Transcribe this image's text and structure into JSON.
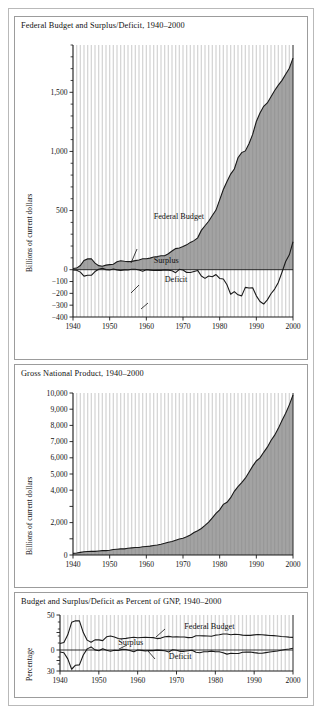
{
  "figure": {
    "background": "#ffffff",
    "frame_color": "#b9b9b9",
    "area_fill": "#808080",
    "gridline_color": "#d6d6d6",
    "line_color": "#1a1a1a"
  },
  "chart_data": [
    {
      "id": "federal-budget",
      "type": "area",
      "title": "Federal Budget and Surplus/Deficit, 1940–2000",
      "xlabel": "",
      "ylabel": "Billions of current dollars",
      "xlim": [
        1940,
        2000
      ],
      "ylim": [
        -400,
        1900
      ],
      "ytick_values": [
        1500,
        1000,
        500,
        0,
        -100,
        -200,
        -300,
        -400
      ],
      "ytick_labels": [
        "1,500",
        "1,000",
        "500",
        "0",
        "−100",
        "−200",
        "−300",
        "−400"
      ],
      "xtick_values": [
        1940,
        1950,
        1960,
        1970,
        1980,
        1990,
        2000
      ],
      "xtick_labels": [
        "1940",
        "1950",
        "1960",
        "1970",
        "1980",
        "1990",
        "2000"
      ],
      "grid": "vertical-yearly",
      "annotations": [
        {
          "text": "Federal Budget",
          "x": 1962,
          "y": 430
        },
        {
          "text": "Surplus",
          "x": 1962,
          "y": 60
        },
        {
          "text": "Deficit",
          "x": 1965,
          "y": -105
        }
      ],
      "series": [
        {
          "name": "Federal Budget",
          "kind": "area",
          "x": [
            1940,
            1941,
            1942,
            1943,
            1944,
            1945,
            1946,
            1947,
            1948,
            1949,
            1950,
            1951,
            1952,
            1953,
            1954,
            1955,
            1956,
            1957,
            1958,
            1959,
            1960,
            1961,
            1962,
            1963,
            1964,
            1965,
            1966,
            1967,
            1968,
            1969,
            1970,
            1971,
            1972,
            1973,
            1974,
            1975,
            1976,
            1977,
            1978,
            1979,
            1980,
            1981,
            1982,
            1983,
            1984,
            1985,
            1986,
            1987,
            1988,
            1989,
            1990,
            1991,
            1992,
            1993,
            1994,
            1995,
            1996,
            1997,
            1998,
            1999,
            2000
          ],
          "values": [
            9.5,
            13.7,
            35.1,
            78.6,
            91.3,
            92.7,
            55.2,
            34.5,
            29.8,
            38.8,
            42.6,
            45.5,
            67.7,
            76.1,
            70.9,
            68.4,
            70.6,
            76.6,
            82.4,
            92.1,
            92.2,
            97.7,
            106.8,
            111.3,
            118.5,
            118.2,
            134.5,
            157.5,
            178.1,
            183.6,
            195.6,
            210.2,
            230.7,
            245.7,
            269.4,
            332.3,
            371.8,
            409.2,
            458.7,
            504.0,
            590.9,
            678.2,
            745.7,
            808.4,
            851.8,
            946.3,
            990.4,
            1004.1,
            1064.5,
            1143.7,
            1253.2,
            1324.4,
            1381.6,
            1409.5,
            1461.9,
            1515.8,
            1560.6,
            1601.3,
            1652.6,
            1703.0,
            1789.1
          ]
        },
        {
          "name": "Surplus/Deficit",
          "kind": "line",
          "x": [
            1940,
            1941,
            1942,
            1943,
            1944,
            1945,
            1946,
            1947,
            1948,
            1949,
            1950,
            1951,
            1952,
            1953,
            1954,
            1955,
            1956,
            1957,
            1958,
            1959,
            1960,
            1961,
            1962,
            1963,
            1964,
            1965,
            1966,
            1967,
            1968,
            1969,
            1970,
            1971,
            1972,
            1973,
            1974,
            1975,
            1976,
            1977,
            1978,
            1979,
            1980,
            1981,
            1982,
            1983,
            1984,
            1985,
            1986,
            1987,
            1988,
            1989,
            1990,
            1991,
            1992,
            1993,
            1994,
            1995,
            1996,
            1997,
            1998,
            1999,
            2000
          ],
          "values": [
            -2.9,
            -4.9,
            -20.5,
            -54.6,
            -47.6,
            -47.6,
            -15.9,
            4.0,
            11.8,
            0.6,
            -3.1,
            6.1,
            -1.5,
            -6.5,
            -1.2,
            -3.0,
            3.9,
            3.4,
            -2.8,
            -12.8,
            0.3,
            -3.3,
            -7.1,
            -4.8,
            -5.9,
            -1.4,
            -3.7,
            -8.6,
            -25.2,
            3.2,
            -2.8,
            -23.0,
            -23.4,
            -14.9,
            -6.1,
            -53.2,
            -73.7,
            -53.7,
            -59.2,
            -40.7,
            -73.8,
            -79.0,
            -128.0,
            -207.8,
            -185.4,
            -212.3,
            -221.2,
            -149.7,
            -155.2,
            -152.6,
            -221.0,
            -269.2,
            -290.3,
            -255.1,
            -203.2,
            -164.0,
            -107.4,
            -21.9,
            69.2,
            125.6,
            236.2
          ]
        }
      ]
    },
    {
      "id": "gnp",
      "type": "area",
      "title": "Gross National Product, 1940–2000",
      "xlabel": "",
      "ylabel": "Billions of current dollars",
      "xlim": [
        1940,
        2000
      ],
      "ylim": [
        0,
        10000
      ],
      "ytick_values": [
        10000,
        9000,
        8000,
        7000,
        6000,
        5000,
        4000,
        3000,
        2000,
        1000,
        0
      ],
      "ytick_labels": [
        "10,000",
        "9,000",
        "8,000",
        "7,000",
        "6,000",
        "5,000",
        "4,000",
        "",
        "2,000",
        "",
        "0"
      ],
      "xtick_values": [
        1940,
        1950,
        1960,
        1970,
        1980,
        1990,
        2000
      ],
      "xtick_labels": [
        "1940",
        "1950",
        "1960",
        "1970",
        "1980",
        "1990",
        "2000"
      ],
      "grid": "vertical-yearly",
      "annotations": [],
      "series": [
        {
          "name": "Gross National Product",
          "kind": "area",
          "x": [
            1940,
            1941,
            1942,
            1943,
            1944,
            1945,
            1946,
            1947,
            1948,
            1949,
            1950,
            1951,
            1952,
            1953,
            1954,
            1955,
            1956,
            1957,
            1958,
            1959,
            1960,
            1961,
            1962,
            1963,
            1964,
            1965,
            1966,
            1967,
            1968,
            1969,
            1970,
            1971,
            1972,
            1973,
            1974,
            1975,
            1976,
            1977,
            1978,
            1979,
            1980,
            1981,
            1982,
            1983,
            1984,
            1985,
            1986,
            1987,
            1988,
            1989,
            1990,
            1991,
            1992,
            1993,
            1994,
            1995,
            1996,
            1997,
            1998,
            1999,
            2000
          ],
          "values": [
            101,
            127,
            162,
            199,
            219,
            223,
            222,
            244,
            270,
            267,
            294,
            339,
            358,
            379,
            380,
            415,
            438,
            461,
            467,
            507,
            529,
            548,
            589,
            622,
            668,
            724,
            792,
            834,
            911,
            985,
            1039,
            1128,
            1241,
            1386,
            1501,
            1635,
            1825,
            2030,
            2294,
            2563,
            2789,
            3128,
            3255,
            3536,
            3933,
            4220,
            4463,
            4740,
            5104,
            5484,
            5803,
            5995,
            6338,
            6657,
            7072,
            7398,
            7817,
            8304,
            8747,
            9268,
            9873
          ]
        }
      ]
    },
    {
      "id": "percent-of-gnp",
      "type": "line",
      "title": "Budget and Surplus/Deficit as Percent of GNP, 1940–2000",
      "xlabel": "",
      "ylabel": "Percentage",
      "xlim": [
        1940,
        2000
      ],
      "ylim": [
        -30,
        50
      ],
      "ytick_values": [
        50,
        25,
        0,
        -15,
        -30
      ],
      "ytick_labels": [
        "50",
        "",
        "0",
        "",
        "30"
      ],
      "xtick_values": [
        1940,
        1950,
        1960,
        1970,
        1980,
        1990,
        2000
      ],
      "xtick_labels": [
        "1940",
        "1950",
        "1960",
        "1970",
        "1980",
        "1990",
        "2000"
      ],
      "grid": "vertical-yearly",
      "annotations": [
        {
          "text": "Federal Budget",
          "x": 1972,
          "y": 30
        },
        {
          "text": "Surplus",
          "x": 1955,
          "y": 7
        },
        {
          "text": "Deficit",
          "x": 1968,
          "y": -13
        }
      ],
      "series": [
        {
          "name": "Federal Budget",
          "kind": "line",
          "x": [
            1940,
            1941,
            1942,
            1943,
            1944,
            1945,
            1946,
            1947,
            1948,
            1949,
            1950,
            1951,
            1952,
            1953,
            1954,
            1955,
            1956,
            1957,
            1958,
            1959,
            1960,
            1961,
            1962,
            1963,
            1964,
            1965,
            1966,
            1967,
            1968,
            1969,
            1970,
            1971,
            1972,
            1973,
            1974,
            1975,
            1976,
            1977,
            1978,
            1979,
            1980,
            1981,
            1982,
            1983,
            1984,
            1985,
            1986,
            1987,
            1988,
            1989,
            1990,
            1991,
            1992,
            1993,
            1994,
            1995,
            1996,
            1997,
            1998,
            1999,
            2000
          ],
          "values": [
            9.4,
            10.8,
            21.7,
            39.5,
            41.7,
            41.6,
            24.9,
            14.1,
            11.0,
            14.5,
            14.5,
            13.4,
            18.9,
            20.1,
            18.7,
            16.5,
            16.1,
            16.6,
            17.6,
            18.2,
            17.4,
            17.8,
            18.1,
            17.9,
            17.7,
            16.3,
            17.0,
            18.9,
            19.5,
            18.6,
            18.8,
            18.6,
            18.6,
            17.7,
            17.9,
            20.3,
            20.4,
            20.2,
            20.0,
            19.7,
            21.2,
            21.7,
            22.9,
            22.9,
            21.7,
            22.4,
            22.2,
            21.2,
            20.9,
            20.9,
            21.6,
            22.1,
            21.8,
            21.2,
            20.7,
            20.5,
            20.0,
            19.3,
            18.9,
            18.4,
            18.1
          ]
        },
        {
          "name": "Surplus/Deficit",
          "kind": "line",
          "x": [
            1940,
            1941,
            1942,
            1943,
            1944,
            1945,
            1946,
            1947,
            1948,
            1949,
            1950,
            1951,
            1952,
            1953,
            1954,
            1955,
            1956,
            1957,
            1958,
            1959,
            1960,
            1961,
            1962,
            1963,
            1964,
            1965,
            1966,
            1967,
            1968,
            1969,
            1970,
            1971,
            1972,
            1973,
            1974,
            1975,
            1976,
            1977,
            1978,
            1979,
            1980,
            1981,
            1982,
            1983,
            1984,
            1985,
            1986,
            1987,
            1988,
            1989,
            1990,
            1991,
            1992,
            1993,
            1994,
            1995,
            1996,
            1997,
            1998,
            1999,
            2000
          ],
          "values": [
            -2.9,
            -3.9,
            -12.7,
            -27.5,
            -21.7,
            -21.3,
            -7.2,
            1.6,
            4.4,
            0.2,
            -1.1,
            1.8,
            -0.4,
            -1.7,
            -0.3,
            -0.7,
            0.9,
            0.7,
            -0.6,
            -2.5,
            0.1,
            -0.6,
            -1.2,
            -0.8,
            -0.9,
            -0.2,
            -0.5,
            -1.1,
            -2.8,
            0.3,
            -0.3,
            -2.0,
            -1.9,
            -1.1,
            -0.4,
            -3.3,
            -4.0,
            -2.6,
            -2.6,
            -1.6,
            -2.6,
            -2.5,
            -3.9,
            -5.9,
            -4.7,
            -5.0,
            -5.0,
            -3.2,
            -3.0,
            -2.8,
            -3.8,
            -4.5,
            -4.6,
            -3.8,
            -2.9,
            -2.2,
            -1.4,
            -0.3,
            0.8,
            1.4,
            2.4
          ]
        }
      ]
    }
  ]
}
